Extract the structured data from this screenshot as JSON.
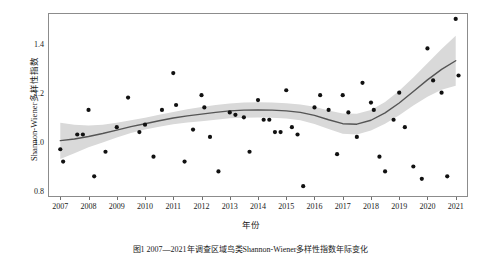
{
  "figure": {
    "caption": "图1  2007—2021年调查区域鸟类Shannon-Wiener多样性指数年际变化"
  },
  "axes": {
    "y_title": "Shannon-Wiener多样性指数",
    "x_title": "年份",
    "y_ticks": [
      "0.8",
      "1.0",
      "1.2",
      "1.4"
    ],
    "x_ticks": [
      "2007",
      "2008",
      "2009",
      "2010",
      "2011",
      "2012",
      "2013",
      "2014",
      "2015",
      "2016",
      "2017",
      "2018",
      "2019",
      "2020",
      "2021"
    ]
  },
  "style": {
    "point_color": "#111111",
    "line_color": "#555555",
    "ribbon_color": "#d9d9d9",
    "panel_border": "#8c8c8c",
    "background": "#ffffff"
  },
  "chart_data": {
    "type": "scatter",
    "title": "",
    "xlabel": "年份",
    "ylabel": "Shannon-Wiener多样性指数",
    "xlim": [
      2006.6,
      2021.4
    ],
    "ylim": [
      0.78,
      1.52
    ],
    "grid": false,
    "legend": "none",
    "y_ticks": [
      0.8,
      1.0,
      1.2,
      1.4
    ],
    "x_ticks": [
      2007,
      2008,
      2009,
      2010,
      2011,
      2012,
      2013,
      2014,
      2015,
      2016,
      2017,
      2018,
      2019,
      2020,
      2021
    ],
    "points": [
      {
        "x": 2007.0,
        "y": 0.97
      },
      {
        "x": 2007.1,
        "y": 0.92
      },
      {
        "x": 2007.6,
        "y": 1.03
      },
      {
        "x": 2007.8,
        "y": 1.03
      },
      {
        "x": 2008.0,
        "y": 1.13
      },
      {
        "x": 2008.2,
        "y": 0.86
      },
      {
        "x": 2008.6,
        "y": 0.96
      },
      {
        "x": 2009.0,
        "y": 1.06
      },
      {
        "x": 2009.4,
        "y": 1.18
      },
      {
        "x": 2009.8,
        "y": 1.04
      },
      {
        "x": 2010.0,
        "y": 1.07
      },
      {
        "x": 2010.3,
        "y": 0.94
      },
      {
        "x": 2010.6,
        "y": 1.13
      },
      {
        "x": 2011.0,
        "y": 1.28
      },
      {
        "x": 2011.1,
        "y": 1.15
      },
      {
        "x": 2011.4,
        "y": 0.92
      },
      {
        "x": 2011.7,
        "y": 1.05
      },
      {
        "x": 2012.0,
        "y": 1.19
      },
      {
        "x": 2012.1,
        "y": 1.14
      },
      {
        "x": 2012.3,
        "y": 1.02
      },
      {
        "x": 2012.6,
        "y": 0.88
      },
      {
        "x": 2013.0,
        "y": 1.12
      },
      {
        "x": 2013.2,
        "y": 1.11
      },
      {
        "x": 2013.5,
        "y": 1.1
      },
      {
        "x": 2013.7,
        "y": 0.96
      },
      {
        "x": 2014.0,
        "y": 1.17
      },
      {
        "x": 2014.2,
        "y": 1.09
      },
      {
        "x": 2014.4,
        "y": 1.09
      },
      {
        "x": 2014.6,
        "y": 1.04
      },
      {
        "x": 2014.8,
        "y": 1.04
      },
      {
        "x": 2015.0,
        "y": 1.21
      },
      {
        "x": 2015.2,
        "y": 1.06
      },
      {
        "x": 2015.4,
        "y": 1.03
      },
      {
        "x": 2015.6,
        "y": 0.82
      },
      {
        "x": 2016.0,
        "y": 1.14
      },
      {
        "x": 2016.2,
        "y": 1.19
      },
      {
        "x": 2016.5,
        "y": 1.13
      },
      {
        "x": 2016.8,
        "y": 0.95
      },
      {
        "x": 2017.0,
        "y": 1.19
      },
      {
        "x": 2017.2,
        "y": 1.12
      },
      {
        "x": 2017.5,
        "y": 1.02
      },
      {
        "x": 2017.7,
        "y": 1.24
      },
      {
        "x": 2018.0,
        "y": 1.16
      },
      {
        "x": 2018.1,
        "y": 1.13
      },
      {
        "x": 2018.3,
        "y": 0.94
      },
      {
        "x": 2018.5,
        "y": 0.88
      },
      {
        "x": 2018.8,
        "y": 1.09
      },
      {
        "x": 2019.0,
        "y": 1.2
      },
      {
        "x": 2019.2,
        "y": 1.06
      },
      {
        "x": 2019.5,
        "y": 0.9
      },
      {
        "x": 2019.8,
        "y": 0.85
      },
      {
        "x": 2020.0,
        "y": 1.38
      },
      {
        "x": 2020.2,
        "y": 1.25
      },
      {
        "x": 2020.5,
        "y": 1.2
      },
      {
        "x": 2020.7,
        "y": 0.86
      },
      {
        "x": 2021.0,
        "y": 1.5
      },
      {
        "x": 2021.1,
        "y": 1.27
      }
    ],
    "trend_line": [
      {
        "x": 2007.0,
        "y": 1.005
      },
      {
        "x": 2007.5,
        "y": 1.012
      },
      {
        "x": 2008.0,
        "y": 1.022
      },
      {
        "x": 2008.5,
        "y": 1.034
      },
      {
        "x": 2009.0,
        "y": 1.048
      },
      {
        "x": 2009.5,
        "y": 1.062
      },
      {
        "x": 2010.0,
        "y": 1.074
      },
      {
        "x": 2010.5,
        "y": 1.086
      },
      {
        "x": 2011.0,
        "y": 1.097
      },
      {
        "x": 2011.5,
        "y": 1.106
      },
      {
        "x": 2012.0,
        "y": 1.113
      },
      {
        "x": 2012.5,
        "y": 1.12
      },
      {
        "x": 2013.0,
        "y": 1.126
      },
      {
        "x": 2013.5,
        "y": 1.129
      },
      {
        "x": 2014.0,
        "y": 1.13
      },
      {
        "x": 2014.5,
        "y": 1.129
      },
      {
        "x": 2015.0,
        "y": 1.126
      },
      {
        "x": 2015.5,
        "y": 1.12
      },
      {
        "x": 2016.0,
        "y": 1.108
      },
      {
        "x": 2016.5,
        "y": 1.09
      },
      {
        "x": 2017.0,
        "y": 1.074
      },
      {
        "x": 2017.5,
        "y": 1.072
      },
      {
        "x": 2018.0,
        "y": 1.088
      },
      {
        "x": 2018.5,
        "y": 1.118
      },
      {
        "x": 2019.0,
        "y": 1.158
      },
      {
        "x": 2019.5,
        "y": 1.205
      },
      {
        "x": 2020.0,
        "y": 1.252
      },
      {
        "x": 2020.5,
        "y": 1.295
      },
      {
        "x": 2021.0,
        "y": 1.33
      }
    ],
    "confidence_band": {
      "upper": [
        {
          "x": 2007.0,
          "y": 1.078
        },
        {
          "x": 2007.5,
          "y": 1.07
        },
        {
          "x": 2008.0,
          "y": 1.067
        },
        {
          "x": 2008.5,
          "y": 1.07
        },
        {
          "x": 2009.0,
          "y": 1.078
        },
        {
          "x": 2009.5,
          "y": 1.088
        },
        {
          "x": 2010.0,
          "y": 1.098
        },
        {
          "x": 2010.5,
          "y": 1.11
        },
        {
          "x": 2011.0,
          "y": 1.122
        },
        {
          "x": 2011.5,
          "y": 1.133
        },
        {
          "x": 2012.0,
          "y": 1.142
        },
        {
          "x": 2012.5,
          "y": 1.15
        },
        {
          "x": 2013.0,
          "y": 1.156
        },
        {
          "x": 2013.5,
          "y": 1.16
        },
        {
          "x": 2014.0,
          "y": 1.161
        },
        {
          "x": 2014.5,
          "y": 1.16
        },
        {
          "x": 2015.0,
          "y": 1.157
        },
        {
          "x": 2015.5,
          "y": 1.152
        },
        {
          "x": 2016.0,
          "y": 1.143
        },
        {
          "x": 2016.5,
          "y": 1.128
        },
        {
          "x": 2017.0,
          "y": 1.115
        },
        {
          "x": 2017.5,
          "y": 1.114
        },
        {
          "x": 2018.0,
          "y": 1.13
        },
        {
          "x": 2018.5,
          "y": 1.162
        },
        {
          "x": 2019.0,
          "y": 1.208
        },
        {
          "x": 2019.5,
          "y": 1.262
        },
        {
          "x": 2020.0,
          "y": 1.32
        },
        {
          "x": 2020.5,
          "y": 1.378
        },
        {
          "x": 2021.0,
          "y": 1.432
        }
      ],
      "lower": [
        {
          "x": 2007.0,
          "y": 0.93
        },
        {
          "x": 2007.5,
          "y": 0.954
        },
        {
          "x": 2008.0,
          "y": 0.978
        },
        {
          "x": 2008.5,
          "y": 0.998
        },
        {
          "x": 2009.0,
          "y": 1.018
        },
        {
          "x": 2009.5,
          "y": 1.036
        },
        {
          "x": 2010.0,
          "y": 1.05
        },
        {
          "x": 2010.5,
          "y": 1.062
        },
        {
          "x": 2011.0,
          "y": 1.072
        },
        {
          "x": 2011.5,
          "y": 1.079
        },
        {
          "x": 2012.0,
          "y": 1.084
        },
        {
          "x": 2012.5,
          "y": 1.09
        },
        {
          "x": 2013.0,
          "y": 1.096
        },
        {
          "x": 2013.5,
          "y": 1.098
        },
        {
          "x": 2014.0,
          "y": 1.099
        },
        {
          "x": 2014.5,
          "y": 1.098
        },
        {
          "x": 2015.0,
          "y": 1.095
        },
        {
          "x": 2015.5,
          "y": 1.088
        },
        {
          "x": 2016.0,
          "y": 1.073
        },
        {
          "x": 2016.5,
          "y": 1.052
        },
        {
          "x": 2017.0,
          "y": 1.033
        },
        {
          "x": 2017.5,
          "y": 1.03
        },
        {
          "x": 2018.0,
          "y": 1.046
        },
        {
          "x": 2018.5,
          "y": 1.074
        },
        {
          "x": 2019.0,
          "y": 1.108
        },
        {
          "x": 2019.5,
          "y": 1.148
        },
        {
          "x": 2020.0,
          "y": 1.184
        },
        {
          "x": 2020.5,
          "y": 1.212
        },
        {
          "x": 2021.0,
          "y": 1.228
        }
      ]
    }
  }
}
